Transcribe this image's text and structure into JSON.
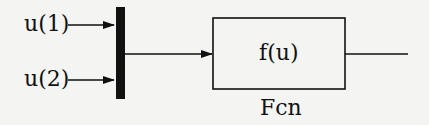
{
  "diagram": {
    "inputs": [
      {
        "label": "u(1)"
      },
      {
        "label": "u(2)"
      }
    ],
    "block": {
      "expression": "f(u)",
      "name": "Fcn"
    },
    "colors": {
      "background": "#f4f4f2",
      "stroke": "#111111"
    }
  }
}
